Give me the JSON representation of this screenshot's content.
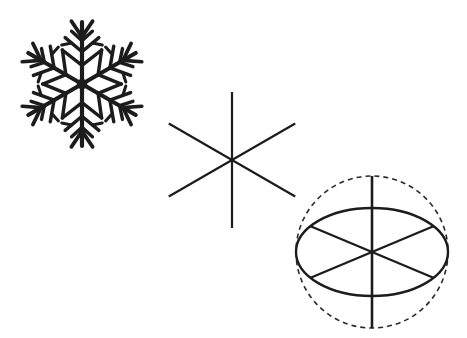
{
  "canvas": {
    "width": 467,
    "height": 338,
    "background_color": "#ffffff",
    "stroke_color": "#1c1c1c",
    "dashed_stroke_color": "#2b2b2b"
  },
  "figures": [
    {
      "id": "snowflake",
      "name": "snowflake-figure",
      "label": "Snowflake with six-fold dendritic symmetry",
      "center": {
        "x": 82,
        "y": 84
      },
      "arm_length": 62,
      "arm_count": 6,
      "arm_angles_deg": [
        270,
        330,
        30,
        90,
        150,
        210
      ],
      "stroke_width": 4.2,
      "fill_style": "solid-black",
      "tip_fork": {
        "start_fraction": 0.76,
        "length": 19,
        "spread_deg": 34
      },
      "side_branches": [
        {
          "position_fraction": 0.3,
          "length": 25,
          "angle_deg": 52,
          "twig_length": 0
        },
        {
          "position_fraction": 0.52,
          "length": 22,
          "angle_deg": 50,
          "twig_fraction": 0.62,
          "twig_length": 10,
          "twig_angle_deg": 52
        },
        {
          "position_fraction": 0.7,
          "length": 14,
          "angle_deg": 48,
          "twig_length": 0
        }
      ]
    },
    {
      "id": "asterisk",
      "name": "six-spoke-asterisk-figure",
      "label": "Six-spoke asterisk showing hexagonal axes",
      "center": {
        "x": 232,
        "y": 160
      },
      "spoke_count": 6,
      "spoke_length": 70,
      "spoke_angles_deg": [
        90,
        150,
        210,
        270,
        330,
        30
      ],
      "stroke_width": 2.2,
      "vertical_spoke_length": 68,
      "diagonal_spoke_length": 73
    },
    {
      "id": "perspective-circle",
      "name": "perspective-circle-figure",
      "label": "Circle in perspective: solid ellipse with dashed true circle and six radii",
      "center": {
        "x": 372,
        "y": 252
      },
      "ellipse": {
        "rx": 76,
        "ry": 44,
        "stroke_width": 2.4,
        "dash": "none"
      },
      "dashed_circle": {
        "r": 76,
        "stroke_width": 1.6,
        "dash": "5,4"
      },
      "vertical_axis": {
        "from_y": 176,
        "to_y": 328,
        "stroke_width": 2.6
      },
      "chords": [
        {
          "name": "chord-upper-left-to-lower-right",
          "x1": 310,
          "y1": 226,
          "x2": 434,
          "y2": 278
        },
        {
          "name": "chord-upper-right-to-lower-left",
          "x1": 434,
          "y1": 226,
          "x2": 310,
          "y2": 278
        }
      ]
    }
  ]
}
